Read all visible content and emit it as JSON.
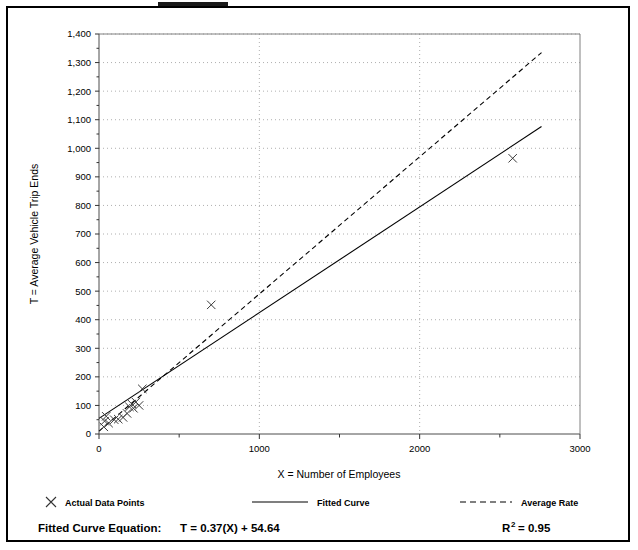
{
  "chart_data": {
    "type": "scatter",
    "title": "",
    "xlabel": "X = Number of Employees",
    "ylabel": "T = Average Vehicle Trip Ends",
    "xlim": [
      0,
      3000
    ],
    "ylim": [
      0,
      1400
    ],
    "grid": true,
    "x_ticks": [
      0,
      1000,
      2000,
      3000
    ],
    "x_tick_labels": [
      "0",
      "1000",
      "2000",
      "3000"
    ],
    "y_ticks": [
      0,
      100,
      200,
      300,
      400,
      500,
      600,
      700,
      800,
      900,
      1000,
      1100,
      1200,
      1300,
      1400
    ],
    "y_tick_labels": [
      "0",
      "100",
      "200",
      "300",
      "400",
      "500",
      "600",
      "700",
      "800",
      "900",
      "1,000",
      "1,100",
      "1,200",
      "1,300",
      "1,400"
    ],
    "legend_position": "below-axes",
    "series": [
      {
        "name": "Actual Data Points",
        "type": "scatter",
        "marker": "x",
        "points": [
          {
            "x": 30,
            "y": 25
          },
          {
            "x": 35,
            "y": 45
          },
          {
            "x": 45,
            "y": 62
          },
          {
            "x": 60,
            "y": 38
          },
          {
            "x": 95,
            "y": 50
          },
          {
            "x": 120,
            "y": 52
          },
          {
            "x": 150,
            "y": 58
          },
          {
            "x": 175,
            "y": 72
          },
          {
            "x": 190,
            "y": 95
          },
          {
            "x": 205,
            "y": 105
          },
          {
            "x": 215,
            "y": 90
          },
          {
            "x": 230,
            "y": 112
          },
          {
            "x": 250,
            "y": 100
          },
          {
            "x": 270,
            "y": 158
          },
          {
            "x": 700,
            "y": 452
          },
          {
            "x": 2580,
            "y": 965
          }
        ]
      },
      {
        "name": "Fitted Curve",
        "type": "line",
        "style": "solid",
        "equation": "T = 0.37(X) + 54.64",
        "endpoints": [
          {
            "x": 0,
            "y": 54.64
          },
          {
            "x": 2760,
            "y": 1076
          }
        ]
      },
      {
        "name": "Average Rate",
        "type": "line",
        "style": "dashed",
        "endpoints": [
          {
            "x": 0,
            "y": 10
          },
          {
            "x": 2760,
            "y": 1335
          }
        ]
      }
    ]
  },
  "legend": {
    "items": [
      {
        "label": "Actual Data Points",
        "symbol": "x-marker"
      },
      {
        "label": "Fitted Curve",
        "symbol": "solid-line"
      },
      {
        "label": "Average Rate",
        "symbol": "dashed-line"
      }
    ]
  },
  "footer": {
    "equation_label": "Fitted Curve Equation:",
    "equation_value": "T = 0.37(X) + 54.64",
    "r2_label": "R",
    "r2_exponent": "2",
    "r2_value": "= 0.95"
  }
}
